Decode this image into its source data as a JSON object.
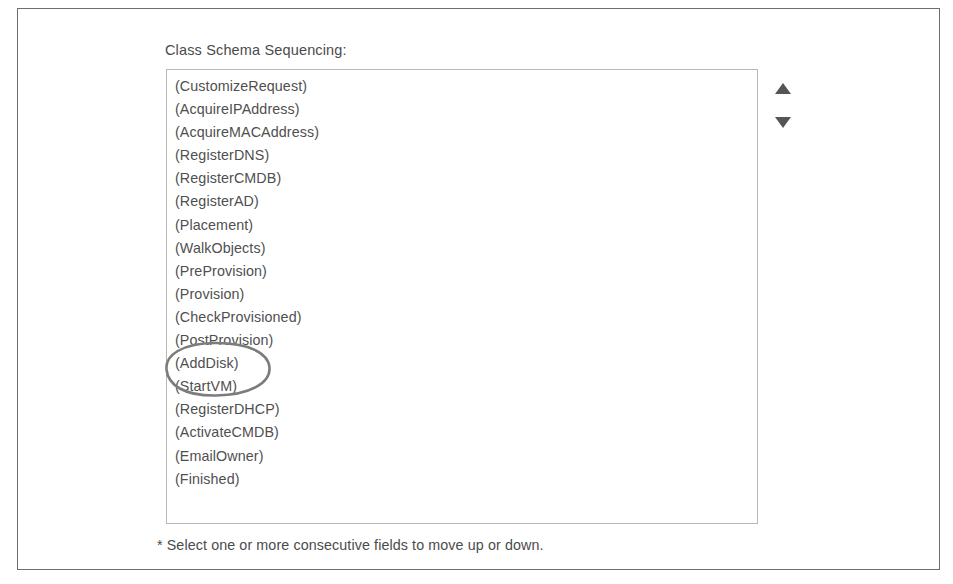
{
  "form": {
    "label": "Class Schema Sequencing:",
    "footer_note": "* Select one or more consecutive fields to move up or down."
  },
  "listbox": {
    "name": "class-schema-sequencing-list",
    "items": [
      "(CustomizeRequest)",
      "(AcquireIPAddress)",
      "(AcquireMACAddress)",
      "(RegisterDNS)",
      "(RegisterCMDB)",
      "(RegisterAD)",
      "(Placement)",
      "(WalkObjects)",
      "(PreProvision)",
      "(Provision)",
      "(CheckProvisioned)",
      "(PostProvision)",
      "(AddDisk)",
      "(StartVM)",
      "(RegisterDHCP)",
      "(ActivateCMDB)",
      "(EmailOwner)",
      "(Finished)"
    ]
  },
  "spinner": {
    "move_up_label": "▲",
    "move_down_label": "▼"
  },
  "annotation": {
    "kind": "hand-drawn-ellipse",
    "encircles": [
      "(AddDisk)",
      "(StartVM)"
    ],
    "color": "#7c7c7c"
  },
  "colors": {
    "page_border": "#6e6e6e",
    "listbox_border": "#b9b9b9",
    "text": "#4f4f4f",
    "arrow": "#555555",
    "background": "#ffffff"
  }
}
